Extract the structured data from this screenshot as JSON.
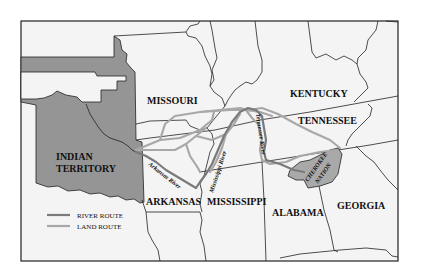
{
  "map": {
    "labels": {
      "missouri": "MISSOURI",
      "kentucky": "KENTUCKY",
      "tennessee": "TENNESSEE",
      "indian_territory_1": "INDIAN",
      "indian_territory_2": "TERRITORY",
      "arkansas": "ARKANSAS",
      "mississippi": "MISSISSIPPI",
      "alabama": "ALABAMA",
      "georgia": "GEORGIA",
      "cherokee_1": "CHEROKEE",
      "cherokee_2": "NATION"
    },
    "rivers": {
      "arkansas_river": "Arkansas River",
      "mississippi_river": "Mississippi River",
      "tennessee_river": "Tennessee River"
    },
    "legend": [
      {
        "label": "RIVER ROUTE",
        "color": "#7a7a7a"
      },
      {
        "label": "LAND ROUTE",
        "color": "#a8a8a8"
      }
    ],
    "colors": {
      "background": "#f4f4f4",
      "territory_fill": "#959595",
      "cherokee_fill": "#a9a9a9",
      "border": "#222222",
      "land_route": "#a8a8a8",
      "river_route": "#7a7a7a"
    }
  }
}
